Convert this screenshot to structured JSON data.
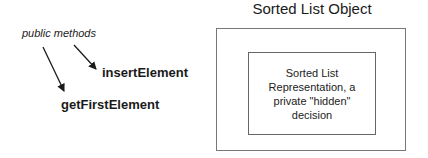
{
  "diagram": {
    "title": "Sorted List Object",
    "public_label": "public methods",
    "methods": [
      {
        "name": "insertElement"
      },
      {
        "name": "getFirstElement"
      }
    ],
    "inner_box": {
      "lines": [
        "Sorted List",
        "Representation, a",
        "private \"hidden\"",
        "decision"
      ]
    },
    "colors": {
      "text": "#1a1a1a",
      "border": "#777777",
      "arrow": "#1a1a1a"
    }
  }
}
